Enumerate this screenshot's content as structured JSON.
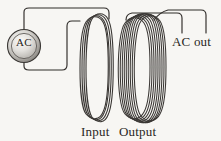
{
  "figure": {
    "background_color": "#f7f6f3",
    "line_color": "#2f2c29",
    "source": {
      "label": "AC",
      "shape": "circle",
      "center_x": 24,
      "center_y": 46,
      "radius": 16,
      "fill_light": "#e8e6e2",
      "fill_dark": "#8d8a85",
      "stroke": "#3a3734"
    },
    "coils": [
      {
        "name": "input-coil",
        "label": "Input",
        "turns": 4,
        "center_x": 93,
        "top_y": 18,
        "bottom_y": 118,
        "half_width": 11
      },
      {
        "name": "output-coil",
        "label": "Output",
        "turns": 9,
        "center_x": 140,
        "top_y": 18,
        "bottom_y": 118,
        "half_width": 16
      }
    ],
    "output_terminal": {
      "label": "AC out",
      "lead_left_x": 182,
      "lead_right_x": 206,
      "lead_bottom_y": 33
    },
    "labels": {
      "input": "Input",
      "output": "Output",
      "ac_out": "AC out",
      "source": "AC"
    }
  }
}
